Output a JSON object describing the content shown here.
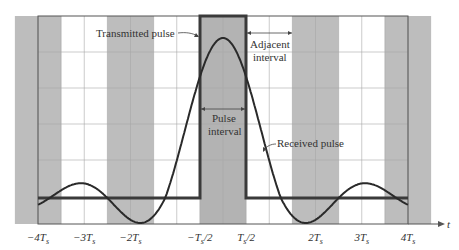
{
  "diagram": {
    "title": "",
    "colors": {
      "background": "#ffffff",
      "band": "#bdbdbd",
      "band_center": "#b3b3b3",
      "grid": "#a8a8a8",
      "frame": "#555555",
      "curve": "#2a2a2a",
      "pulse": "#3a3a3a",
      "text": "#333333"
    },
    "axis": {
      "x_label": "t",
      "tick_labels": [
        {
          "id": "m4",
          "label": "−4T",
          "sub": "s",
          "suffix": "",
          "t": -4
        },
        {
          "id": "m3",
          "label": "−3T",
          "sub": "s",
          "suffix": "",
          "t": -3
        },
        {
          "id": "m2",
          "label": "−2T",
          "sub": "s",
          "suffix": "",
          "t": -2
        },
        {
          "id": "mh",
          "label": "−T",
          "sub": "s",
          "suffix": "/2",
          "t": -0.5
        },
        {
          "id": "ph",
          "label": "T",
          "sub": "s",
          "suffix": "/2",
          "t": 0.5
        },
        {
          "id": "p2",
          "label": "2T",
          "sub": "s",
          "suffix": "",
          "t": 2
        },
        {
          "id": "p3",
          "label": "3T",
          "sub": "s",
          "suffix": "",
          "t": 3
        },
        {
          "id": "p4",
          "label": "4T",
          "sub": "s",
          "suffix": "",
          "t": 4
        }
      ]
    },
    "shaded_intervals_Ts": [
      [
        -4.5,
        -3.5
      ],
      [
        -2.5,
        -1.5
      ],
      [
        -0.5,
        0.5
      ],
      [
        1.5,
        2.5
      ],
      [
        3.5,
        4.5
      ]
    ],
    "annotations": {
      "transmitted_pulse": "Transmitted pulse",
      "adjacent_interval_line1": "Adjacent",
      "adjacent_interval_line2": "interval",
      "pulse_interval_line1": "Pulse",
      "pulse_interval_line2": "interval",
      "received_pulse": "Received pulse"
    },
    "series": [
      {
        "name": "Transmitted pulse",
        "type": "rect",
        "from_Ts": -0.5,
        "to_Ts": 0.5
      },
      {
        "name": "Received pulse",
        "type": "sinc-like",
        "range_Ts": [
          -4,
          4
        ]
      }
    ]
  }
}
